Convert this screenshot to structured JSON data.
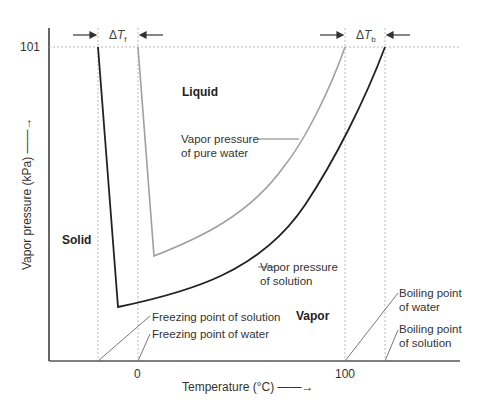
{
  "diagram": {
    "y_axis": {
      "label": "Vapor pressure (kPa) ——→",
      "label_text": "Vapor pressure (kPa)",
      "tick": "101"
    },
    "x_axis": {
      "label": "Temperature (°C)",
      "ticks": [
        "0",
        "100"
      ]
    },
    "regions": {
      "solid": "Solid",
      "liquid": "Liquid",
      "vapor": "Vapor"
    },
    "delta_f": {
      "symbol": "Δ",
      "var": "T",
      "sub": "f"
    },
    "delta_b": {
      "symbol": "Δ",
      "var": "T",
      "sub": "b"
    },
    "curves": {
      "pure_water": {
        "label_line1": "Vapor pressure",
        "label_line2": "of pure water",
        "color": "#a0a0a0"
      },
      "solution": {
        "label_line1": "Vapor pressure",
        "label_line2": "of solution",
        "color": "#222222"
      }
    },
    "annotations": {
      "freeze_solution": "Freezing point of solution",
      "freeze_water": "Freezing point of water",
      "boil_water_1": "Boiling point",
      "boil_water_2": "of water",
      "boil_solution_1": "Boiling point",
      "boil_solution_2": "of solution"
    },
    "colors": {
      "axis": "#333333",
      "dashed": "#999999"
    }
  }
}
